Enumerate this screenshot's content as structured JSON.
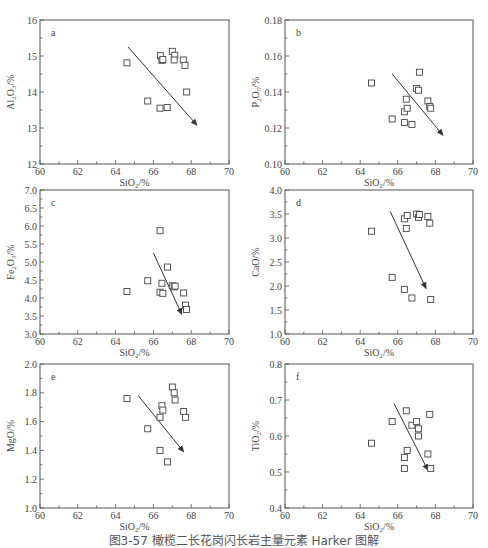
{
  "caption": "图3-57 橄榄二长花岗闪长岩主量元素 Harker 图解",
  "chart_data": [
    {
      "type": "scatter",
      "panel": "a",
      "xlabel": "SiO2/%",
      "ylabel": "Al2O3/%",
      "xlim": [
        60,
        70
      ],
      "ylim": [
        12,
        16
      ],
      "xticks": [
        "60",
        "62",
        "64",
        "66",
        "68",
        "70"
      ],
      "yticks": [
        "12",
        "13",
        "14",
        "15",
        "16"
      ],
      "points": [
        [
          64.6,
          14.81
        ],
        [
          65.7,
          13.75
        ],
        [
          66.37,
          15.01
        ],
        [
          66.45,
          14.88
        ],
        [
          66.5,
          14.9
        ],
        [
          66.35,
          13.55
        ],
        [
          66.73,
          13.57
        ],
        [
          67.0,
          15.13
        ],
        [
          67.13,
          15.02
        ],
        [
          67.1,
          14.89
        ],
        [
          67.58,
          14.89
        ],
        [
          67.67,
          14.74
        ],
        [
          67.76,
          14.0
        ]
      ],
      "arrow": [
        [
          64.66,
          15.25
        ],
        [
          68.3,
          13.08
        ]
      ]
    },
    {
      "type": "scatter",
      "panel": "b",
      "xlabel": "SiO2/%",
      "ylabel": "P2O5/%",
      "xlim": [
        60,
        70
      ],
      "ylim": [
        0.1,
        0.18
      ],
      "xticks": [
        "60",
        "62",
        "64",
        "66",
        "68",
        "70"
      ],
      "yticks": [
        "0.10",
        "0.12",
        "0.14",
        "0.16",
        "0.18"
      ],
      "points": [
        [
          64.6,
          0.145
        ],
        [
          65.7,
          0.125
        ],
        [
          66.35,
          0.129
        ],
        [
          66.45,
          0.136
        ],
        [
          66.5,
          0.131
        ],
        [
          66.35,
          0.123
        ],
        [
          66.75,
          0.122
        ],
        [
          67.0,
          0.142
        ],
        [
          67.1,
          0.141
        ],
        [
          67.15,
          0.151
        ],
        [
          67.6,
          0.135
        ],
        [
          67.7,
          0.132
        ],
        [
          67.75,
          0.131
        ]
      ],
      "arrow": [
        [
          65.7,
          0.15
        ],
        [
          68.4,
          0.116
        ]
      ]
    },
    {
      "type": "scatter",
      "panel": "c",
      "xlabel": "SiO2/%",
      "ylabel": "Fe2O3/%",
      "xlim": [
        60,
        70
      ],
      "ylim": [
        3.0,
        7.0
      ],
      "xticks": [
        "60",
        "62",
        "64",
        "66",
        "68",
        "70"
      ],
      "yticks": [
        "3.0",
        "3.5",
        "4.0",
        "4.5",
        "5.0",
        "5.5",
        "6.0",
        "6.5",
        "7.0"
      ],
      "points": [
        [
          64.6,
          4.18
        ],
        [
          65.7,
          4.48
        ],
        [
          66.35,
          5.87
        ],
        [
          66.35,
          4.16
        ],
        [
          66.45,
          4.41
        ],
        [
          66.5,
          4.13
        ],
        [
          66.75,
          4.86
        ],
        [
          67.0,
          4.34
        ],
        [
          67.1,
          4.31
        ],
        [
          67.15,
          4.33
        ],
        [
          67.6,
          4.14
        ],
        [
          67.7,
          3.8
        ],
        [
          67.75,
          3.68
        ]
      ],
      "arrow": [
        [
          66.0,
          5.25
        ],
        [
          67.5,
          3.55
        ]
      ]
    },
    {
      "type": "scatter",
      "panel": "d",
      "xlabel": "SiO2/%",
      "ylabel": "CaO/%",
      "xlim": [
        60,
        70
      ],
      "ylim": [
        1.0,
        4.0
      ],
      "xticks": [
        "60",
        "62",
        "64",
        "66",
        "68",
        "70"
      ],
      "yticks": [
        "1.0",
        "1.5",
        "2.0",
        "2.5",
        "3.0",
        "3.5",
        "4.0"
      ],
      "points": [
        [
          64.6,
          3.14
        ],
        [
          65.7,
          2.18
        ],
        [
          66.35,
          3.4
        ],
        [
          66.45,
          3.2
        ],
        [
          66.5,
          3.47
        ],
        [
          66.35,
          1.93
        ],
        [
          66.75,
          1.75
        ],
        [
          67.0,
          3.5
        ],
        [
          67.1,
          3.43
        ],
        [
          67.15,
          3.49
        ],
        [
          67.6,
          3.45
        ],
        [
          67.7,
          3.31
        ],
        [
          67.75,
          1.72
        ]
      ],
      "arrow": [
        [
          65.6,
          3.55
        ],
        [
          67.5,
          1.95
        ]
      ]
    },
    {
      "type": "scatter",
      "panel": "e",
      "xlabel": "SiO2/%",
      "ylabel": "MgO/%",
      "xlim": [
        60,
        70
      ],
      "ylim": [
        1.0,
        2.0
      ],
      "xticks": [
        "60",
        "62",
        "64",
        "66",
        "68",
        "70"
      ],
      "yticks": [
        "1.0",
        "1.2",
        "1.4",
        "1.6",
        "1.8",
        "2.0"
      ],
      "points": [
        [
          64.6,
          1.76
        ],
        [
          65.7,
          1.55
        ],
        [
          66.35,
          1.63
        ],
        [
          66.45,
          1.71
        ],
        [
          66.5,
          1.68
        ],
        [
          66.35,
          1.4
        ],
        [
          66.75,
          1.32
        ],
        [
          67.0,
          1.84
        ],
        [
          67.1,
          1.8
        ],
        [
          67.15,
          1.75
        ],
        [
          67.6,
          1.67
        ],
        [
          67.7,
          1.63
        ]
      ],
      "arrow": [
        [
          65.2,
          1.78
        ],
        [
          67.6,
          1.39
        ]
      ]
    },
    {
      "type": "scatter",
      "panel": "f",
      "xlabel": "SiO2/%",
      "ylabel": "TiO2/%",
      "xlim": [
        60,
        70
      ],
      "ylim": [
        0.4,
        0.8
      ],
      "xticks": [
        "60",
        "62",
        "64",
        "66",
        "68",
        "70"
      ],
      "yticks": [
        "0.4",
        "0.5",
        "0.6",
        "0.7",
        "0.8"
      ],
      "points": [
        [
          64.6,
          0.58
        ],
        [
          65.7,
          0.64
        ],
        [
          66.35,
          0.54
        ],
        [
          66.35,
          0.51
        ],
        [
          66.45,
          0.67
        ],
        [
          66.5,
          0.56
        ],
        [
          66.75,
          0.63
        ],
        [
          67.0,
          0.64
        ],
        [
          67.1,
          0.62
        ],
        [
          67.1,
          0.6
        ],
        [
          67.6,
          0.55
        ],
        [
          67.7,
          0.66
        ],
        [
          67.75,
          0.51
        ]
      ],
      "arrow": [
        [
          65.8,
          0.69
        ],
        [
          67.6,
          0.505
        ]
      ]
    }
  ],
  "labels": {
    "a": {
      "letter": "a",
      "ylabel": "Al₂O₃/%",
      "xlabel": "SiO₂/%"
    },
    "b": {
      "letter": "b",
      "ylabel": "P₂O₅/%",
      "xlabel": "SiO₂/%"
    },
    "c": {
      "letter": "c",
      "ylabel": "Fe₂O₃/%",
      "xlabel": "SiO₂/%"
    },
    "d": {
      "letter": "d",
      "ylabel": "CaO/%",
      "xlabel": "SiO₂/%"
    },
    "e": {
      "letter": "e",
      "ylabel": "MgO/%",
      "xlabel": "SiO₂/%"
    },
    "f": {
      "letter": "f",
      "ylabel": "TiO₂/%",
      "xlabel": "SiO₂/%"
    }
  }
}
